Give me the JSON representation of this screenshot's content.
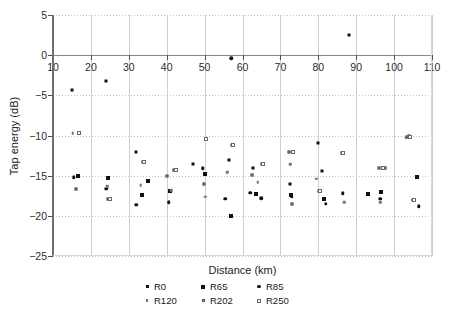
{
  "chart_data": {
    "type": "scatter",
    "title": "",
    "xlabel": "Distance (km)",
    "ylabel": "Tap energy (dB)",
    "xlim": [
      10,
      110
    ],
    "ylim": [
      -25,
      5
    ],
    "xticks": [
      10,
      20,
      30,
      40,
      50,
      60,
      70,
      80,
      90,
      100,
      110
    ],
    "yticks": [
      5,
      0,
      -5,
      -10,
      -15,
      -20,
      -25
    ],
    "xticklabels": [
      "10",
      "20",
      "30",
      "40",
      "50",
      "60",
      "70",
      "80",
      "90",
      "100",
      "110"
    ],
    "yticklabels": [
      "5",
      "0",
      "−5",
      "−10",
      "−15",
      "−20",
      "−25"
    ],
    "grid": {
      "vertical": "solid-light-gray",
      "horizontal": "dotted-light-gray",
      "zero_line": true
    },
    "legend_position": "below-axes",
    "series": [
      {
        "name": "R0",
        "marker": "small-square",
        "color": "#111111",
        "points": [
          [
            15.0,
            -4.3
          ],
          [
            24.0,
            -3.2
          ],
          [
            32.0,
            -12.0
          ],
          [
            47.0,
            -13.6
          ],
          [
            56.5,
            -13.0
          ],
          [
            62.8,
            -14.1
          ],
          [
            72.5,
            -16.0
          ],
          [
            80.0,
            -10.9
          ],
          [
            81.0,
            -14.4
          ],
          [
            88.0,
            2.5
          ],
          [
            104.0,
            -10.1
          ]
        ]
      },
      {
        "name": "R65",
        "marker": "square",
        "color": "#111111",
        "points": [
          [
            16.5,
            -15.1
          ],
          [
            24.5,
            -15.3
          ],
          [
            33.5,
            -17.4
          ],
          [
            35.0,
            -15.7
          ],
          [
            41.0,
            -16.9
          ],
          [
            50.0,
            -14.8
          ],
          [
            57.0,
            -20.0
          ],
          [
            63.5,
            -17.3
          ],
          [
            72.8,
            -17.4
          ],
          [
            81.5,
            -17.9
          ],
          [
            93.0,
            -17.3
          ],
          [
            96.5,
            -17.0
          ],
          [
            106.0,
            -15.2
          ]
        ]
      },
      {
        "name": "R85",
        "marker": "dot",
        "color": "#111111",
        "points": [
          [
            15.5,
            -15.2
          ],
          [
            24.0,
            -16.6
          ],
          [
            32.0,
            -18.6
          ],
          [
            40.5,
            -18.3
          ],
          [
            49.5,
            -14.1
          ],
          [
            55.5,
            -17.9
          ],
          [
            62.0,
            -17.1
          ],
          [
            65.0,
            -17.8
          ],
          [
            73.0,
            -17.6
          ],
          [
            82.0,
            -18.5
          ],
          [
            86.5,
            -17.2
          ],
          [
            96.3,
            -17.9
          ],
          [
            105.0,
            -18.0
          ],
          [
            106.5,
            -18.8
          ],
          [
            57.0,
            -0.4
          ]
        ]
      },
      {
        "name": "R120",
        "marker": "tiny-dot",
        "color": "#777777",
        "points": [
          [
            15.2,
            -9.7
          ],
          [
            24.3,
            -16.3
          ],
          [
            33.2,
            -16.2
          ],
          [
            41.2,
            -16.8
          ],
          [
            50.2,
            -17.6
          ],
          [
            56.0,
            -14.6
          ],
          [
            64.0,
            -15.8
          ],
          [
            72.6,
            -13.6
          ],
          [
            79.5,
            -15.4
          ],
          [
            86.8,
            -18.3
          ],
          [
            96.4,
            -18.3
          ],
          [
            103.2,
            -10.3
          ]
        ]
      },
      {
        "name": "R202",
        "marker": "gray-square",
        "color": "#9a9a9a",
        "points": [
          [
            16.0,
            -16.6
          ],
          [
            24.6,
            -17.9
          ],
          [
            33.8,
            -13.3
          ],
          [
            40.0,
            -15.0
          ],
          [
            42.0,
            -14.3
          ],
          [
            49.8,
            -16.0
          ],
          [
            57.3,
            -11.2
          ],
          [
            62.5,
            -14.9
          ],
          [
            65.2,
            -13.5
          ],
          [
            72.2,
            -12.1
          ],
          [
            73.0,
            -18.5
          ],
          [
            80.2,
            -16.9
          ],
          [
            86.2,
            -12.2
          ],
          [
            96.0,
            -14.1
          ],
          [
            97.5,
            -14.0
          ],
          [
            103.5,
            -10.2
          ]
        ]
      },
      {
        "name": "R250",
        "marker": "open-square",
        "color": "#ffffff",
        "points": [
          [
            16.8,
            -9.7
          ],
          [
            25.0,
            -17.9
          ],
          [
            34.0,
            -13.3
          ],
          [
            42.5,
            -14.3
          ],
          [
            50.5,
            -10.4
          ],
          [
            57.5,
            -11.2
          ],
          [
            65.5,
            -13.5
          ],
          [
            73.2,
            -12.1
          ],
          [
            80.5,
            -16.9
          ],
          [
            86.5,
            -12.2
          ],
          [
            97.0,
            -14.1
          ],
          [
            104.2,
            -10.2
          ],
          [
            105.2,
            -18.0
          ]
        ]
      }
    ]
  },
  "legend": {
    "rows": [
      [
        {
          "label": "R0",
          "series": "R0"
        },
        {
          "label": "R65",
          "series": "R65"
        },
        {
          "label": "R85",
          "series": "R85"
        }
      ],
      [
        {
          "label": "R120",
          "series": "R120"
        },
        {
          "label": "R202",
          "series": "R202"
        },
        {
          "label": "R250",
          "series": "R250"
        }
      ]
    ]
  }
}
